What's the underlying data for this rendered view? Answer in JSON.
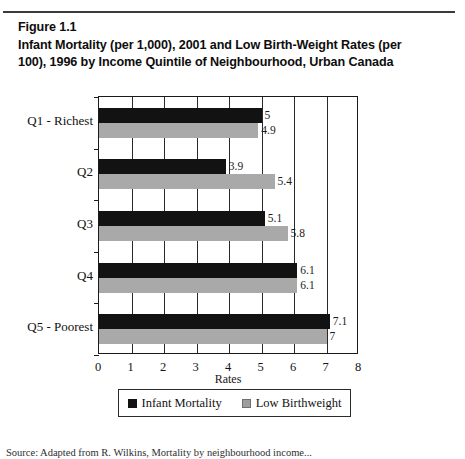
{
  "figure": {
    "number_label": "Figure 1.1",
    "title_line_1": "Infant Mortality (per 1,000), 2001 and Low Birth-Weight Rates (per",
    "title_line_2": "100), 1996 by Income Quintile of Neighbourhood, Urban Canada",
    "source_note": "Source: Adapted from R. Wilkins, Mortality by neighbourhood income..."
  },
  "chart_data": {
    "type": "bar",
    "orientation": "horizontal",
    "title": "Infant Mortality (per 1,000), 2001 and Low Birth-Weight Rates (per 100), 1996 by Income Quintile of Neighbourhood, Urban Canada",
    "categories": [
      "Q1 - Richest",
      "Q2",
      "Q3",
      "Q4",
      "Q5 - Poorest"
    ],
    "series": [
      {
        "name": "Infant Mortality",
        "color": "#121212",
        "values": [
          5,
          3.9,
          5.1,
          6.1,
          7.1
        ],
        "labels": [
          "5",
          "3.9",
          "5.1",
          "6.1",
          "7.1"
        ]
      },
      {
        "name": "Low Birthweight",
        "color": "#a9a9a9",
        "values": [
          4.9,
          5.4,
          5.8,
          6.1,
          7
        ],
        "labels": [
          "4.9",
          "5.4",
          "5.8",
          "6.1",
          "7"
        ]
      }
    ],
    "xlabel": "Rates",
    "ylabel": "",
    "xlim": [
      0,
      8
    ],
    "xticks": [
      "0",
      "1",
      "2",
      "3",
      "4",
      "5",
      "6",
      "7",
      "8"
    ],
    "grid": true,
    "legend_position": "bottom"
  },
  "legend": {
    "items": [
      {
        "label": "Infant Mortality",
        "swatch": "dark-swatch"
      },
      {
        "label": "Low Birthweight",
        "swatch": "gray-swatch"
      }
    ]
  }
}
